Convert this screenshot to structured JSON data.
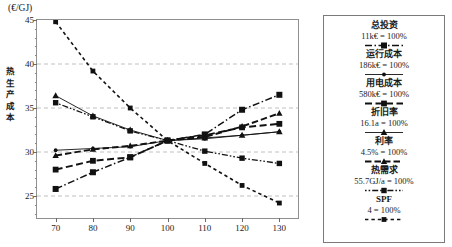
{
  "axis": {
    "y_unit": "(€/GJ)",
    "y_title_chars": [
      "热",
      "生",
      "产",
      "成",
      "本"
    ],
    "y_ticks": [
      "25",
      "30",
      "35",
      "40",
      "45"
    ],
    "x_ticks": [
      "70",
      "80",
      "90",
      "100",
      "110",
      "120",
      "130"
    ]
  },
  "legend": {
    "entries": [
      {
        "name": "总投资",
        "value": "11k€ = 100%",
        "style": "dash-dot-square"
      },
      {
        "name": "运行成本",
        "value": "186k€ = 100%",
        "style": "solid-dot"
      },
      {
        "name": "用电成本",
        "value": "580k€ = 100%",
        "style": "dash-square"
      },
      {
        "name": "折旧率",
        "value": "16.1a = 100%",
        "style": "solid-thick-tri"
      },
      {
        "name": "利率",
        "value": "4.5% = 100%",
        "style": "dash-tri"
      },
      {
        "name": "热需求",
        "value": "55.7GJ/a = 100%",
        "style": "dot-dash-square"
      },
      {
        "name": "SPF",
        "value": "4 = 100%",
        "style": "fine-dot-square"
      }
    ]
  },
  "chart_data": {
    "type": "line",
    "title": "",
    "xlabel": "",
    "ylabel": "热生产成本",
    "yunit": "€/GJ",
    "xlim": [
      65,
      135
    ],
    "ylim": [
      22.5,
      45
    ],
    "grid": "horizontal-dashed",
    "legend_position": "right-outside",
    "x": [
      70,
      80,
      90,
      100,
      110,
      120,
      130
    ],
    "series": [
      {
        "name": "总投资",
        "label": "11k€ = 100%",
        "style": "dash-dot-square",
        "values": [
          25.8,
          27.7,
          29.4,
          31.3,
          32.0,
          34.8,
          36.5
        ]
      },
      {
        "name": "运行成本",
        "label": "186k€ = 100%",
        "style": "solid-dot",
        "values": [
          30.2,
          30.4,
          30.6,
          31.3,
          31.5,
          31.9,
          32.3
        ]
      },
      {
        "name": "用电成本",
        "label": "580k€ = 100%",
        "style": "dash-square",
        "values": [
          28.0,
          29.0,
          29.4,
          31.3,
          31.9,
          32.8,
          33.2
        ]
      },
      {
        "name": "折旧率",
        "label": "16.1a = 100%",
        "style": "solid-thick-tri",
        "values": [
          36.4,
          34.1,
          32.5,
          31.3,
          31.6,
          31.9,
          32.3
        ]
      },
      {
        "name": "利率",
        "label": "4.5% = 100%",
        "style": "dash-tri",
        "values": [
          29.6,
          30.3,
          30.7,
          31.3,
          31.7,
          32.9,
          34.4
        ]
      },
      {
        "name": "热需求",
        "label": "55.7GJ/a = 100%",
        "style": "dot-dash-square",
        "values": [
          35.6,
          34.0,
          32.4,
          31.3,
          30.1,
          29.3,
          28.7
        ]
      },
      {
        "name": "SPF",
        "label": "4 = 100%",
        "style": "fine-dot-square",
        "values": [
          44.8,
          39.2,
          35.0,
          31.3,
          28.7,
          26.2,
          24.2
        ]
      }
    ]
  }
}
